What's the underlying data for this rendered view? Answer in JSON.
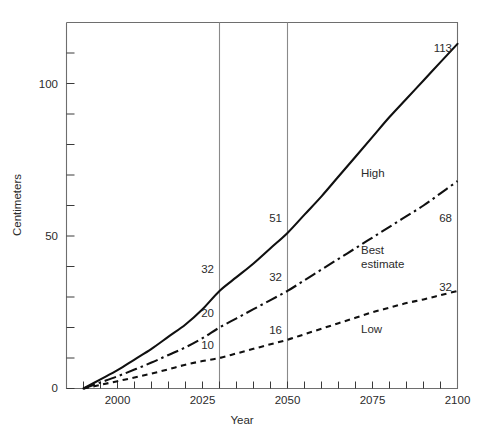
{
  "chart_data": {
    "type": "line",
    "title": "",
    "xlabel": "Year",
    "ylabel": "Centimeters",
    "xlim": [
      1985,
      2100
    ],
    "ylim": [
      0,
      120
    ],
    "grid": false,
    "legend_position": "inline-right",
    "x_ticks_major": [
      2000,
      2025,
      2050,
      2075,
      2100
    ],
    "x_tick_labels": [
      "2000",
      "2025",
      "2050",
      "2075",
      "2100"
    ],
    "x_tick_step_minor": 5,
    "y_ticks_major": [
      0,
      50,
      100
    ],
    "y_tick_labels": [
      "0",
      "50",
      "100"
    ],
    "y_tick_step_minor": 10,
    "reference_lines": [
      {
        "name": "year-2030-line",
        "x": 2030
      },
      {
        "name": "year-2050-line",
        "x": 2050
      }
    ],
    "series": [
      {
        "name": "High",
        "style": "solid",
        "x": [
          1990,
          1995,
          2000,
          2005,
          2010,
          2015,
          2020,
          2025,
          2030,
          2035,
          2040,
          2045,
          2050,
          2055,
          2060,
          2065,
          2070,
          2075,
          2080,
          2085,
          2090,
          2095,
          2100
        ],
        "values": [
          0,
          3,
          6,
          9.5,
          13,
          17,
          21,
          26,
          32,
          36.5,
          41,
          46,
          51,
          57,
          63,
          69.5,
          76,
          82.5,
          89,
          95,
          101,
          107,
          113
        ]
      },
      {
        "name": "Best estimate",
        "style": "dash-dot",
        "x": [
          1990,
          1995,
          2000,
          2005,
          2010,
          2015,
          2020,
          2025,
          2030,
          2035,
          2040,
          2045,
          2050,
          2055,
          2060,
          2065,
          2070,
          2075,
          2080,
          2085,
          2090,
          2095,
          2100
        ],
        "values": [
          0,
          2,
          4,
          6.2,
          8.5,
          11,
          13.5,
          16.5,
          20,
          23,
          26,
          29,
          32,
          35.5,
          39,
          42.5,
          46,
          49.5,
          53,
          56.5,
          60,
          64,
          68
        ]
      },
      {
        "name": "Low",
        "style": "dotted",
        "x": [
          1990,
          1995,
          2000,
          2005,
          2010,
          2015,
          2020,
          2025,
          2030,
          2035,
          2040,
          2045,
          2050,
          2055,
          2060,
          2065,
          2070,
          2075,
          2080,
          2085,
          2090,
          2095,
          2100
        ],
        "values": [
          0,
          1.2,
          2.4,
          3.6,
          4.9,
          6.3,
          7.8,
          9.0,
          10,
          11.5,
          13,
          14.5,
          16,
          17.8,
          19.6,
          21.4,
          23.2,
          25,
          26.5,
          28,
          29.2,
          30.6,
          32
        ]
      }
    ],
    "annotations": [
      {
        "name": "high-2030-value",
        "text": "32",
        "series": "High",
        "year": 2030
      },
      {
        "name": "high-2050-value",
        "text": "51",
        "series": "High",
        "year": 2050
      },
      {
        "name": "high-2100-value",
        "text": "113",
        "series": "High",
        "year": 2100
      },
      {
        "name": "best-2030-value",
        "text": "20",
        "series": "Best estimate",
        "year": 2030
      },
      {
        "name": "best-2050-value",
        "text": "32",
        "series": "Best estimate",
        "year": 2050
      },
      {
        "name": "best-2100-value",
        "text": "68",
        "series": "Best estimate",
        "year": 2100
      },
      {
        "name": "low-2030-value",
        "text": "10",
        "series": "Low",
        "year": 2030
      },
      {
        "name": "low-2050-value",
        "text": "16",
        "series": "Low",
        "year": 2050
      },
      {
        "name": "low-2100-value",
        "text": "32",
        "series": "Low",
        "year": 2100
      }
    ],
    "series_labels": {
      "high": "High",
      "best_line1": "Best",
      "best_line2": "estimate",
      "low": "Low"
    }
  },
  "axis": {
    "y_title": "Centimeters",
    "x_title": "Year",
    "y_labels": {
      "zero": "0",
      "fifty": "50",
      "hundred": "100"
    },
    "x_labels": {
      "t2000": "2000",
      "t2025": "2025",
      "t2050": "2050",
      "t2075": "2075",
      "t2100": "2100"
    }
  },
  "values": {
    "high_2030": "32",
    "high_2050": "51",
    "high_2100": "113",
    "best_2030": "20",
    "best_2050": "32",
    "best_2100": "68",
    "low_2030": "10",
    "low_2050": "16",
    "low_2100": "32"
  },
  "colors": {
    "series_stroke": "#101010",
    "frame": "#6e6e6e",
    "reference": "#8a8a8a",
    "text": "#2b2b2b",
    "background": "#ffffff"
  }
}
